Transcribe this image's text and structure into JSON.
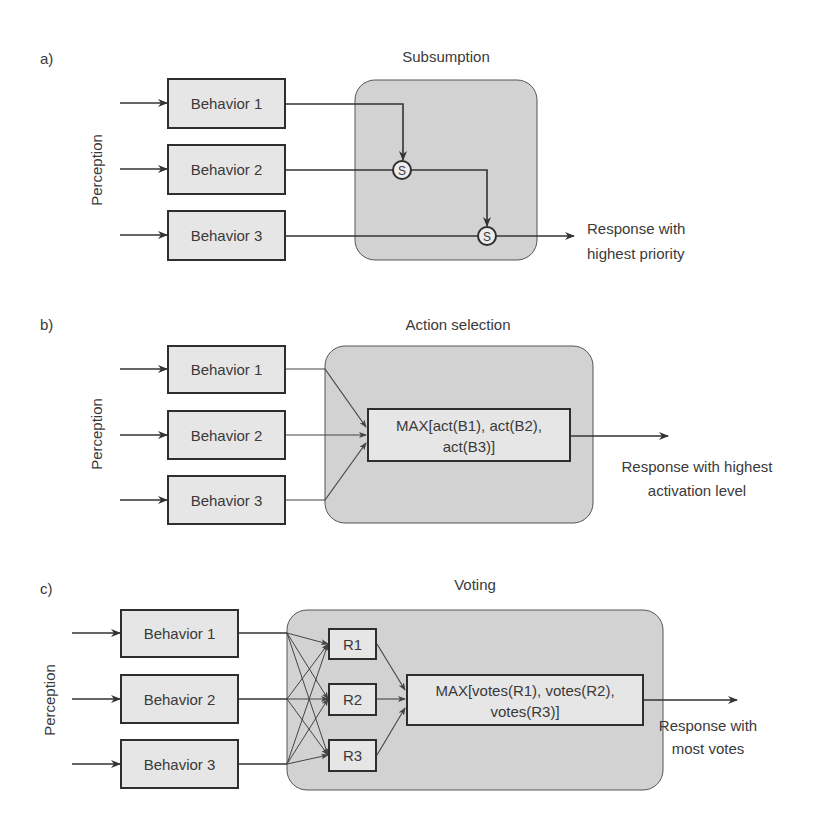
{
  "panels": {
    "a": {
      "label": "a)",
      "title": "Subsumption",
      "perception": "Perception",
      "behaviors": [
        "Behavior 1",
        "Behavior 2",
        "Behavior 3"
      ],
      "node": "S",
      "output": [
        "Response with",
        "highest priority"
      ]
    },
    "b": {
      "label": "b)",
      "title": "Action selection",
      "perception": "Perception",
      "behaviors": [
        "Behavior 1",
        "Behavior 2",
        "Behavior 3"
      ],
      "selector": [
        "MAX[act(B1), act(B2),",
        "act(B3)]"
      ],
      "output": [
        "Response with highest",
        "activation level"
      ]
    },
    "c": {
      "label": "c)",
      "title": "Voting",
      "perception": "Perception",
      "behaviors": [
        "Behavior 1",
        "Behavior 2",
        "Behavior 3"
      ],
      "responses": [
        "R1",
        "R2",
        "R3"
      ],
      "selector": [
        "MAX[votes(R1), votes(R2),",
        "votes(R3)]"
      ],
      "output": [
        "Response with",
        "most votes"
      ]
    }
  },
  "colors": {
    "box_fill": "#e6e6e6",
    "container_fill": "#d2d2d2",
    "stroke": "#2e2e2e"
  }
}
